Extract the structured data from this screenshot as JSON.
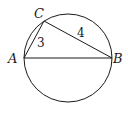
{
  "diagram": {
    "type": "geometry",
    "points": {
      "A": {
        "label": "A"
      },
      "B": {
        "label": "B"
      },
      "C": {
        "label": "C"
      }
    },
    "segments": [
      {
        "from": "A",
        "to": "C",
        "length_label": "3"
      },
      {
        "from": "C",
        "to": "B",
        "length_label": "4"
      },
      {
        "from": "A",
        "to": "B",
        "length_label": ""
      }
    ],
    "labels": {
      "A": "A",
      "B": "B",
      "C": "C",
      "AC": "3",
      "CB": "4"
    },
    "colors": {
      "stroke": "#1a1a1a",
      "background": "#ffffff"
    }
  }
}
